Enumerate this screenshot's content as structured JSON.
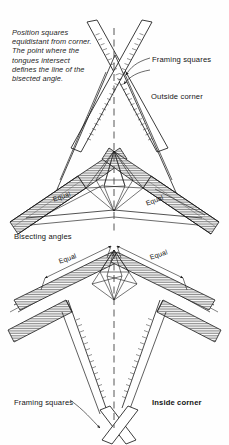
{
  "figure": {
    "background_color": "#fefefe",
    "line_color": "#1a1a1a",
    "hatch_color": "#3a3a3a"
  },
  "caption": {
    "text": "Position squares equidistant from corner. The point where the tongues intersect defines the line of the bisected angle."
  },
  "labels": {
    "framing_squares_top": "Framing squares",
    "outside_corner": "Outside corner",
    "bisecting_angles": "Bisecting angles",
    "framing_squares_bottom": "Framing squares",
    "inside_corner": "Inside corner",
    "equal_upper_left": "Equal",
    "equal_upper_right": "Equal",
    "equal_lower_left": "Equal",
    "equal_lower_right": "Equal"
  },
  "diagrams": [
    {
      "name": "outside-corner-diagram",
      "corner_type": "Outside corner",
      "bisector": "dashed vertical centerline",
      "tool_count": 2,
      "tool_name": "framing square"
    },
    {
      "name": "inside-corner-diagram",
      "corner_type": "Inside corner",
      "bisector": "dashed vertical centerline",
      "tool_count": 2,
      "tool_name": "framing square"
    }
  ]
}
